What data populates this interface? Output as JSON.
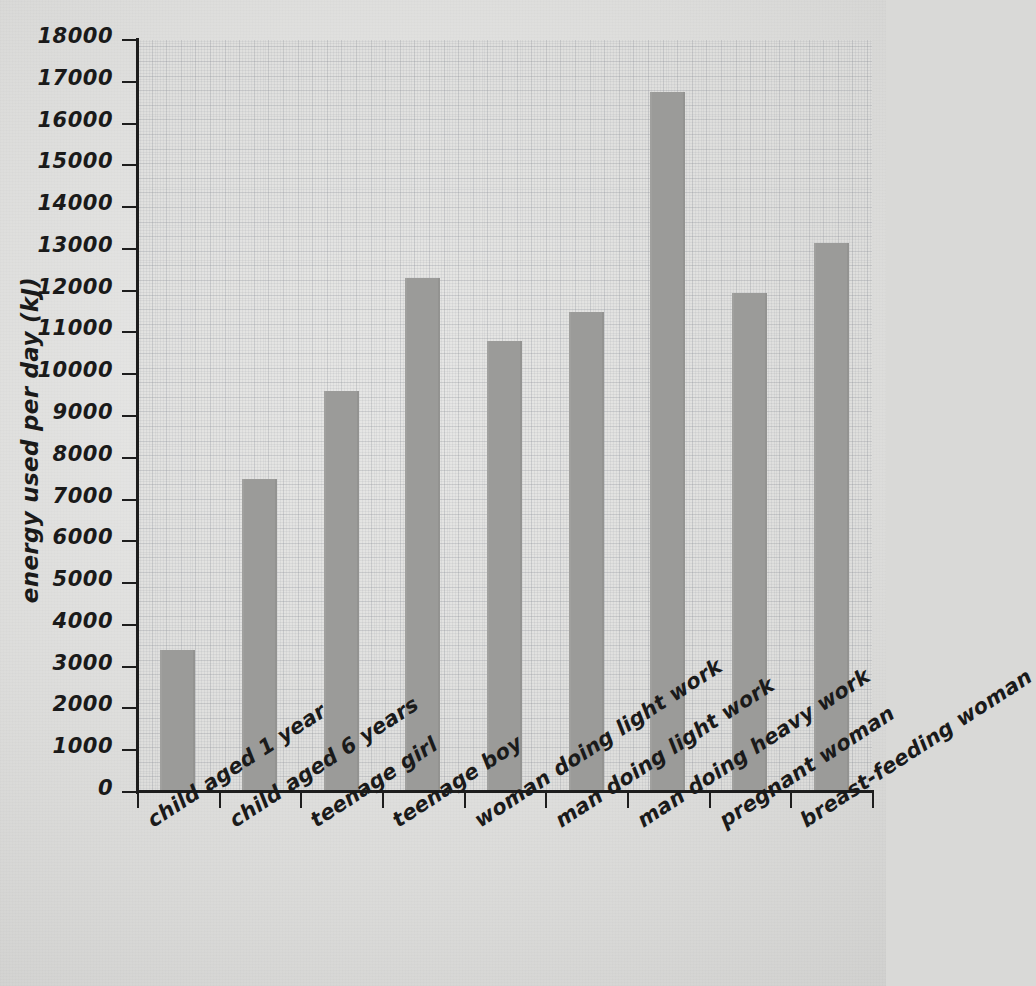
{
  "chart_data": {
    "type": "bar",
    "title": "",
    "xlabel": "",
    "ylabel": "energy used per day (kJ)",
    "ylim": [
      0,
      18000
    ],
    "ytick_step": 1000,
    "yticks": [
      0,
      1000,
      2000,
      3000,
      4000,
      5000,
      6000,
      7000,
      8000,
      9000,
      10000,
      11000,
      12000,
      13000,
      14000,
      15000,
      16000,
      17000,
      18000
    ],
    "ytick_labels": [
      "0",
      "1000",
      "2000",
      "3000",
      "4000",
      "5000",
      "6000",
      "7000",
      "8000",
      "9000",
      "10000",
      "11000",
      "12000",
      "13000",
      "14000",
      "15000",
      "16000",
      "17000",
      "18000"
    ],
    "grid": true,
    "grid_style": "graph-paper",
    "legend": "none",
    "categories": [
      "child aged 1 year",
      "child aged 6 years",
      "teenage girl",
      "teenage boy",
      "woman doing light work",
      "man doing light work",
      "man doing heavy work",
      "pregnant woman",
      "breast-feeding woman"
    ],
    "values": [
      3400,
      7500,
      9600,
      12300,
      10800,
      11500,
      16750,
      11950,
      13150
    ],
    "bar_color": "#9b9b99",
    "axis_color": "#1d1d1d",
    "background_color": "#d7d7d5",
    "plot_background_color": "#e2e2e0"
  },
  "axis": {
    "y_title": "energy used per day (kJ)"
  }
}
